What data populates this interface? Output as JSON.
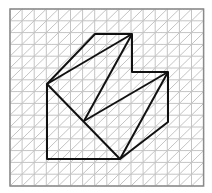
{
  "diagram": {
    "type": "isometric-grid-figure",
    "grid": {
      "x0": 10,
      "y0": 9,
      "cols": 16,
      "rows": 15,
      "cell": 12.1,
      "line_color": "#c4c4c4",
      "border_color": "#8a8a8a"
    },
    "figure": {
      "stroke": "#111111",
      "points": [
        [
          95,
          34
        ],
        [
          132,
          34
        ],
        [
          132,
          72
        ],
        [
          168,
          72
        ],
        [
          168,
          122
        ],
        [
          120,
          159
        ],
        [
          47,
          159
        ],
        [
          47,
          84
        ]
      ],
      "inner_lines": [
        [
          [
            47,
            84
          ],
          [
            132,
            34
          ]
        ],
        [
          [
            84,
            121
          ],
          [
            132,
            34
          ]
        ],
        [
          [
            84,
            121
          ],
          [
            168,
            72
          ]
        ],
        [
          [
            168,
            72
          ],
          [
            120,
            159
          ]
        ],
        [
          [
            47,
            84
          ],
          [
            120,
            159
          ]
        ]
      ]
    }
  }
}
